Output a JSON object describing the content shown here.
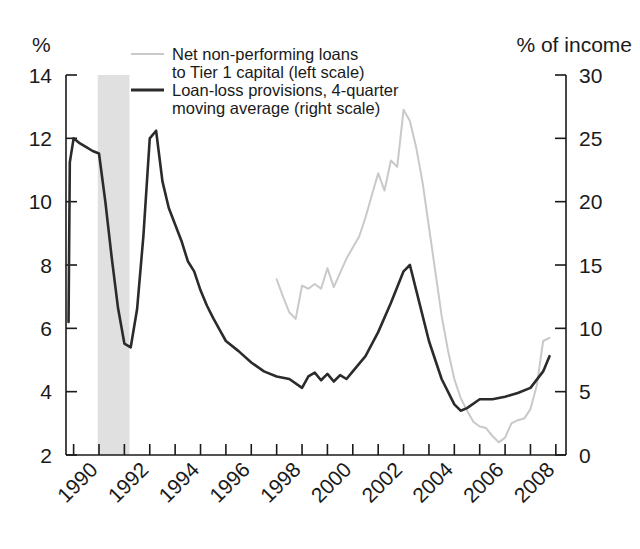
{
  "chart_data": {
    "type": "line",
    "title": "",
    "subtitle": "",
    "left_axis": {
      "label": "%",
      "ticks": [
        2,
        4,
        6,
        8,
        10,
        12,
        14
      ],
      "ylim": [
        2,
        14
      ]
    },
    "right_axis": {
      "label": "% of income",
      "ticks": [
        0,
        5,
        10,
        15,
        20,
        25,
        30
      ],
      "ylim": [
        0,
        30
      ]
    },
    "xlabel": "",
    "xlim": [
      1988.7,
      2008.4
    ],
    "xticks": [
      1990,
      1992,
      1994,
      1996,
      1998,
      2000,
      2002,
      2004,
      2006,
      2008
    ],
    "xtick_labels": [
      "1990",
      "1992",
      "1994",
      "1996",
      "1998",
      "2000",
      "2002",
      "2004",
      "2006",
      "2008"
    ],
    "xtick_minor_every_year": true,
    "grid": false,
    "legend_position": "top-center",
    "shaded_bands": [
      {
        "name": "recession",
        "x_start": 1989.95,
        "x_end": 1991.2,
        "color": "#e0e0e0"
      }
    ],
    "series": [
      {
        "name": "Net non-performing loans to Tier 1 capital (left scale)",
        "short_name": "net-npl-tier1",
        "axis": "left",
        "color": "#c9c9c9",
        "line_width": 2.0,
        "x": [
          1997.0,
          1997.25,
          1997.5,
          1997.75,
          1998.0,
          1998.25,
          1998.5,
          1998.75,
          1999.0,
          1999.25,
          1999.5,
          1999.75,
          2000.0,
          2000.25,
          2000.5,
          2000.75,
          2001.0,
          2001.25,
          2001.5,
          2001.75,
          2002.0,
          2002.25,
          2002.5,
          2002.75,
          2003.0,
          2003.25,
          2003.5,
          2003.75,
          2004.0,
          2004.25,
          2004.5,
          2004.75,
          2005.0,
          2005.25,
          2005.5,
          2005.75,
          2006.0,
          2006.25,
          2006.5,
          2006.75,
          2007.0,
          2007.25,
          2007.5,
          2007.75
        ],
        "values": [
          7.55,
          7.0,
          6.5,
          6.3,
          7.35,
          7.25,
          7.4,
          7.25,
          7.9,
          7.3,
          7.75,
          8.2,
          8.55,
          8.9,
          9.5,
          10.2,
          10.9,
          10.35,
          11.3,
          11.1,
          12.9,
          12.55,
          11.7,
          10.6,
          9.2,
          7.8,
          6.4,
          5.3,
          4.4,
          3.8,
          3.4,
          3.05,
          2.9,
          2.85,
          2.6,
          2.4,
          2.55,
          3.0,
          3.1,
          3.15,
          3.45,
          4.2,
          5.6,
          5.7
        ]
      },
      {
        "name": "Loan-loss provisions, 4-quarter moving average (right scale)",
        "short_name": "loan-loss-provisions",
        "axis": "right",
        "color": "#2b2b2b",
        "line_width": 2.6,
        "x": [
          1988.8,
          1988.85,
          1989.0,
          1989.25,
          1989.5,
          1989.75,
          1990.0,
          1990.25,
          1990.5,
          1990.75,
          1991.0,
          1991.25,
          1991.5,
          1991.75,
          1992.0,
          1992.25,
          1992.5,
          1992.75,
          1993.0,
          1993.25,
          1993.5,
          1993.75,
          1994.0,
          1994.25,
          1994.5,
          1994.75,
          1995.0,
          1995.5,
          1996.0,
          1996.5,
          1997.0,
          1997.5,
          1998.0,
          1998.25,
          1998.5,
          1998.75,
          1999.0,
          1999.25,
          1999.5,
          1999.75,
          2000.0,
          2000.5,
          2001.0,
          2001.5,
          2002.0,
          2002.25,
          2002.5,
          2003.0,
          2003.5,
          2004.0,
          2004.25,
          2004.5,
          2005.0,
          2005.5,
          2006.0,
          2006.5,
          2007.0,
          2007.5,
          2007.75
        ],
        "values": [
          10.5,
          23.1,
          25.0,
          24.6,
          24.3,
          24.0,
          23.8,
          20.0,
          15.6,
          11.6,
          8.8,
          8.5,
          11.5,
          17.3,
          25.0,
          25.6,
          21.6,
          19.5,
          18.2,
          16.9,
          15.3,
          14.5,
          13.0,
          11.8,
          10.8,
          9.9,
          9.0,
          8.2,
          7.3,
          6.6,
          6.2,
          6.0,
          5.3,
          6.2,
          6.5,
          5.9,
          6.4,
          5.8,
          6.3,
          6.0,
          6.6,
          7.8,
          9.7,
          12.0,
          14.5,
          15.0,
          13.0,
          9.0,
          6.0,
          4.0,
          3.5,
          3.7,
          4.4,
          4.4,
          4.6,
          4.9,
          5.3,
          6.6,
          7.8
        ]
      }
    ]
  },
  "legend": {
    "items": [
      {
        "swatch_color": "#c9c9c9",
        "line1": "Net non-performing loans",
        "line2": "to Tier 1 capital (left scale)"
      },
      {
        "swatch_color": "#2b2b2b",
        "line1": "Loan-loss provisions, 4-quarter",
        "line2": "moving average (right scale)"
      }
    ]
  },
  "axis_titles": {
    "left": "%",
    "right": "% of income"
  },
  "colors": {
    "background": "#ffffff",
    "axis": "#1a1a1a",
    "text": "#1a1a1a",
    "series_light": "#c9c9c9",
    "series_dark": "#2b2b2b",
    "band": "#e0e0e0"
  }
}
